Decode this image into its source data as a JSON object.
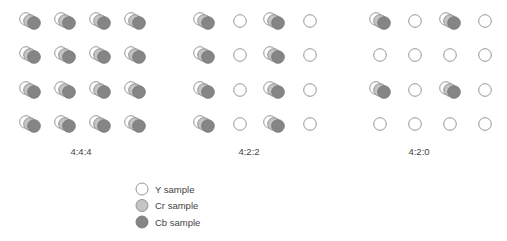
{
  "colors": {
    "y_fill": "#ffffff",
    "cr_fill": "#c4c4c4",
    "cb_fill": "#858585",
    "stroke": "#8a8a8a"
  },
  "panels": [
    {
      "label": "4:4:4",
      "pattern": [
        [
          "full",
          "full",
          "full",
          "full"
        ],
        [
          "full",
          "full",
          "full",
          "full"
        ],
        [
          "full",
          "full",
          "full",
          "full"
        ],
        [
          "full",
          "full",
          "full",
          "full"
        ]
      ]
    },
    {
      "label": "4:2:2",
      "pattern": [
        [
          "full",
          "y",
          "full",
          "y"
        ],
        [
          "full",
          "y",
          "full",
          "y"
        ],
        [
          "full",
          "y",
          "full",
          "y"
        ],
        [
          "full",
          "y",
          "full",
          "y"
        ]
      ]
    },
    {
      "label": "4:2:0",
      "pattern": [
        [
          "full",
          "y",
          "full",
          "y"
        ],
        [
          "y",
          "y",
          "y",
          "y"
        ],
        [
          "full",
          "y",
          "full",
          "y"
        ],
        [
          "y",
          "y",
          "y",
          "y"
        ]
      ]
    }
  ],
  "legend": [
    {
      "key": "y",
      "label": "Y sample"
    },
    {
      "key": "cr",
      "label": "Cr sample"
    },
    {
      "key": "cb",
      "label": "Cb sample"
    }
  ]
}
